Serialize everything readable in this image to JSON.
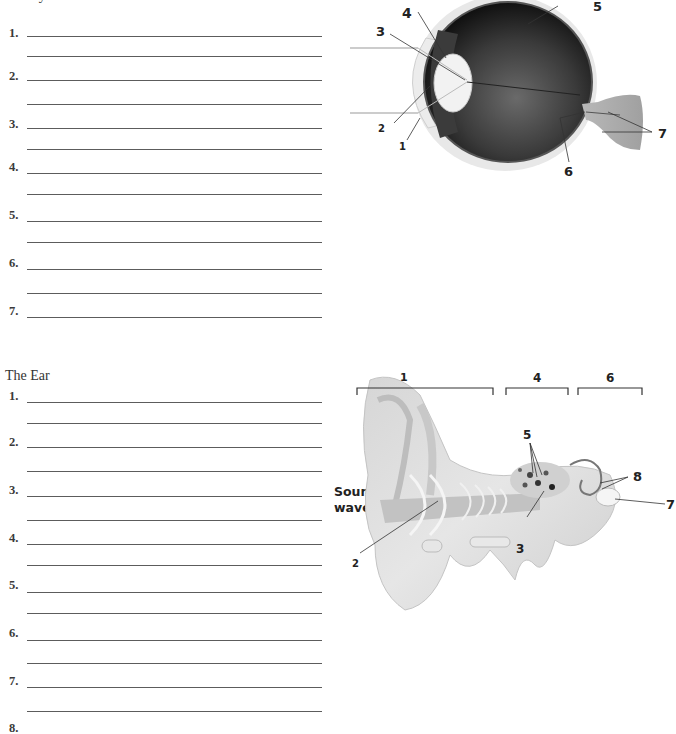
{
  "eye": {
    "title": "The Eye",
    "items": [
      {
        "num": "1.",
        "answer": ""
      },
      {
        "num": "2.",
        "answer": ""
      },
      {
        "num": "3.",
        "answer": ""
      },
      {
        "num": "4.",
        "answer": ""
      },
      {
        "num": "5.",
        "answer": ""
      },
      {
        "num": "6.",
        "answer": ""
      },
      {
        "num": "7.",
        "answer": ""
      }
    ],
    "diagram_labels": [
      "1",
      "2",
      "3",
      "4",
      "5",
      "6",
      "7"
    ]
  },
  "ear": {
    "title": "The Ear",
    "items": [
      {
        "num": "1.",
        "answer": ""
      },
      {
        "num": "2.",
        "answer": ""
      },
      {
        "num": "3.",
        "answer": ""
      },
      {
        "num": "4.",
        "answer": ""
      },
      {
        "num": "5.",
        "answer": ""
      },
      {
        "num": "6.",
        "answer": ""
      },
      {
        "num": "7.",
        "answer": ""
      },
      {
        "num": "8.",
        "answer": ""
      }
    ],
    "diagram_labels": [
      "1",
      "2",
      "3",
      "4",
      "5",
      "6",
      "7",
      "8"
    ],
    "sound_label_line1": "Sound",
    "sound_label_line2": "waves"
  }
}
